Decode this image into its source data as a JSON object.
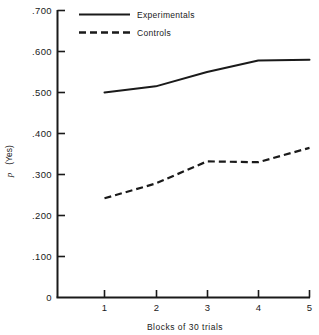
{
  "chart_data": {
    "type": "line",
    "title": "",
    "xlabel": "Blocks of 30 trials",
    "ylabel": "p (Yes)",
    "x": [
      1,
      2,
      3,
      4,
      5
    ],
    "categories": [
      "1",
      "2",
      "3",
      "4",
      "5"
    ],
    "xlim": [
      0,
      5.35
    ],
    "ylim": [
      0,
      0.7
    ],
    "grid": false,
    "legend_position": "top-center",
    "series": [
      {
        "name": "Experimentals",
        "style": "solid",
        "color": "#1a1a1a",
        "values": [
          0.5,
          0.515,
          0.55,
          0.578,
          0.58
        ]
      },
      {
        "name": "Controls",
        "style": "dashed",
        "color": "#1a1a1a",
        "values": [
          0.242,
          0.278,
          0.332,
          0.33,
          0.365
        ]
      }
    ],
    "ytick_labels": [
      ".700",
      ".600",
      ".500",
      ".400",
      ".300",
      ".200",
      ".100",
      "0"
    ],
    "ytick_values": [
      0.7,
      0.6,
      0.5,
      0.4,
      0.3,
      0.2,
      0.1,
      0
    ],
    "xtick_labels": [
      "1",
      "2",
      "3",
      "4",
      "5"
    ],
    "xtick_values": [
      1,
      2,
      3,
      4,
      5
    ],
    "origin_label": "0"
  },
  "legend": {
    "entries": [
      {
        "label": "Experimentals"
      },
      {
        "label": "Controls"
      }
    ]
  },
  "axes": {
    "y_title_main": "p",
    "y_title_paren": "(Yes)",
    "x_title": "Blocks of 30 trials"
  }
}
